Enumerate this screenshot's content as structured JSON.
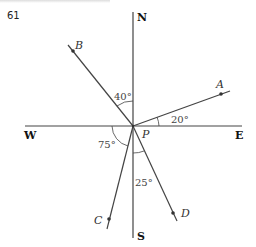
{
  "problem_number": "61",
  "compass": {
    "north": "N",
    "south": "S",
    "east": "E",
    "west": "W"
  },
  "center_label": "P",
  "rays": [
    {
      "label": "A",
      "angle": "20°",
      "reference": "E"
    },
    {
      "label": "B",
      "angle": "40°",
      "reference": "N"
    },
    {
      "label": "C",
      "angle": "75°",
      "reference": "W"
    },
    {
      "label": "D",
      "angle": "25°",
      "reference": "S"
    }
  ]
}
